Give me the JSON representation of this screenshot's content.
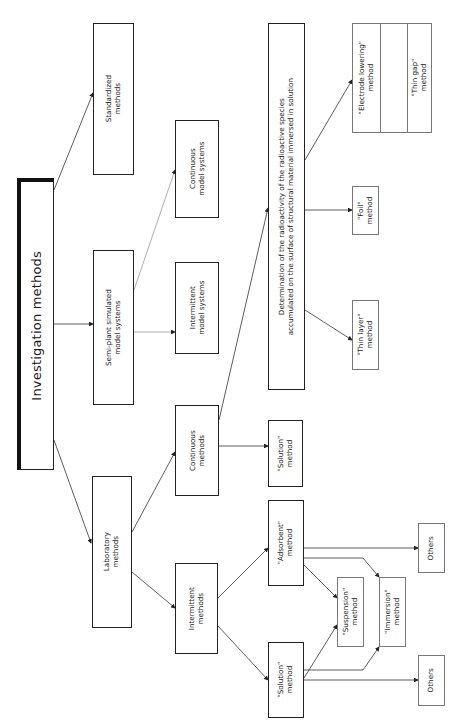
{
  "diagram": {
    "root": {
      "label": "Investigation methods"
    },
    "level1": {
      "standardized": "Standardized\nmethods",
      "semi_plant": "Semi-plant simulated\nmodel systems",
      "laboratory": "Laboratory\nmethods"
    },
    "level2": {
      "continuous_model": "Continuous\nmodel systems",
      "intermittent_model": "Intermittent\nmodel systems",
      "continuous_methods": "Continuous\nmethods",
      "intermittent_methods": "Intermittent\nmethods"
    },
    "level3": {
      "determination": "Determination of the radioactivity of the radioactive species\naccumulated on the surface of structural material immersed in solution",
      "solution_top": "\"Solution\"\nmethod",
      "adsorbent": "\"Adsorbent\"\nmethod",
      "solution_bottom": "\"Solution\"\nmethod"
    },
    "level4": {
      "thin_layer": "\"Thin layer\"\nmethod",
      "foil": "\"Foil\"\nmethod",
      "electrode_lowering": "\"Electrode lowering\"\nmethod",
      "thin_gap": "\"Thin gap\"\nmethod",
      "suspension": "\"Suspension\"\nmethod",
      "immersion": "\"Immersion\"\nmethod",
      "others_top": "Others",
      "others_bottom": "Others"
    },
    "colors": {
      "line": "#333333",
      "box_border": "#222222",
      "light_border": "#777777"
    }
  }
}
